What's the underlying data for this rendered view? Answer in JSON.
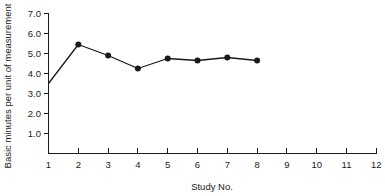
{
  "chart_data": {
    "type": "line",
    "title": "",
    "xlabel": "Study No.",
    "ylabel": "Basic minutes per unit of measurement",
    "x": [
      1,
      2,
      3,
      4,
      5,
      6,
      7,
      8
    ],
    "values": [
      3.5,
      5.45,
      4.9,
      4.25,
      4.75,
      4.65,
      4.8,
      4.65
    ],
    "series": [
      {
        "name": "Basic minutes per unit of measurement",
        "x": [
          1,
          2,
          3,
          4,
          5,
          6,
          7,
          8
        ],
        "values": [
          3.5,
          5.45,
          4.9,
          4.25,
          4.75,
          4.65,
          4.8,
          4.65
        ],
        "marker": "filled-circle",
        "marker_at_first_point": false,
        "color": "#1a1a1a"
      }
    ],
    "xlim": [
      1,
      12
    ],
    "ylim": [
      0,
      7
    ],
    "xticks": [
      1,
      2,
      3,
      4,
      5,
      6,
      7,
      8,
      9,
      10,
      11,
      12
    ],
    "xtick_labels": [
      "1",
      "2",
      "3",
      "4",
      "5",
      "6",
      "7",
      "8",
      "9",
      "10",
      "11",
      "12"
    ],
    "yticks": [
      1.0,
      2.0,
      3.0,
      4.0,
      5.0,
      6.0,
      7.0
    ],
    "ytick_labels": [
      "1.0",
      "2.0",
      "3.0",
      "4.0",
      "5.0",
      "6.0",
      "7.0"
    ],
    "grid": false,
    "legend": false,
    "legend_position": "none"
  }
}
